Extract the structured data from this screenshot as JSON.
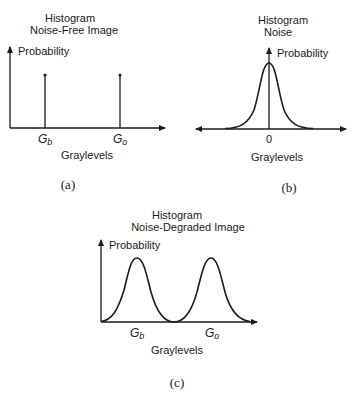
{
  "panels": {
    "a": {
      "title_line1": "Histogram",
      "title_line2": "Noise-Free Image",
      "ylabel": "Probability",
      "xlabel": "Graylevels",
      "tick_b": "G",
      "tick_b_sub": "b",
      "tick_o": "G",
      "tick_o_sub": "o",
      "caption": "(a)"
    },
    "b": {
      "title_line1": "Histogram",
      "title_line2": "Noise",
      "ylabel": "Probability",
      "xlabel": "Graylevels",
      "tick_zero": "0",
      "caption": "(b)"
    },
    "c": {
      "title_line1": "Histogram",
      "title_line2": "Noise-Degraded Image",
      "ylabel": "Probability",
      "xlabel": "Graylevels",
      "tick_b": "G",
      "tick_b_sub": "b",
      "tick_o": "G",
      "tick_o_sub": "o",
      "caption": "(c)"
    }
  },
  "colors": {
    "ink": "#1a1a1a",
    "background": "#ffffff"
  }
}
